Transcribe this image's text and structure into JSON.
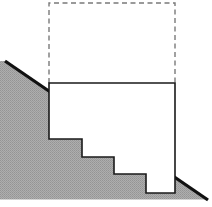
{
  "figure": {
    "canvas": {
      "width": 212,
      "height": 207
    },
    "colors": {
      "background": "#ffffff",
      "hatch_fill": "#a9a9a9",
      "hatch_dot": "#8f8f8f",
      "outline": "#1a1a1a",
      "slope_edge": "#111111",
      "dashed_stroke": "#7a7a7a",
      "white_fill": "#ffffff"
    },
    "strokes": {
      "outline_width": 1.6,
      "slope_width": 3.2,
      "dashed_width": 1.4,
      "dash_pattern": "5 3.5"
    },
    "shapes": {
      "slope_wedge": {
        "name": "hatched-slope-wedge",
        "description": "Gray dotted/hatched ground mass bounded above by a descending straight slope line",
        "points": "5,61 208,200 208,199 0,199 0,61",
        "path": "M 5,61 L 208,200 L 208,199.5 L 0,199.5 L 0,61 Z"
      },
      "slope_line": {
        "name": "slope-edge-line",
        "from": {
          "x": 5,
          "y": 61
        },
        "to": {
          "x": 208,
          "y": 200
        }
      },
      "solid_polygon": {
        "name": "staircase-cut-outline",
        "description": "White staircase-shaped cut region with four descending steps",
        "path": "M 49,83 L 175,83 L 175,193 L 146,193 L 146,174 L 114,174 L 114,157 L 82,157 L 82,139 L 49,139 Z",
        "vertices": [
          {
            "x": 49,
            "y": 83
          },
          {
            "x": 175,
            "y": 83
          },
          {
            "x": 175,
            "y": 193
          },
          {
            "x": 146,
            "y": 193
          },
          {
            "x": 146,
            "y": 174
          },
          {
            "x": 114,
            "y": 174
          },
          {
            "x": 114,
            "y": 157
          },
          {
            "x": 82,
            "y": 157
          },
          {
            "x": 82,
            "y": 139
          },
          {
            "x": 49,
            "y": 139
          }
        ]
      },
      "dashed_rect": {
        "name": "dashed-projection-rectangle",
        "description": "Dashed rectangle projected above the solid cut, sharing its top edge",
        "x": 49,
        "y": 3,
        "width": 126,
        "height": 80,
        "path": "M 49,83 L 49,3 L 175,3 L 175,83"
      }
    }
  }
}
